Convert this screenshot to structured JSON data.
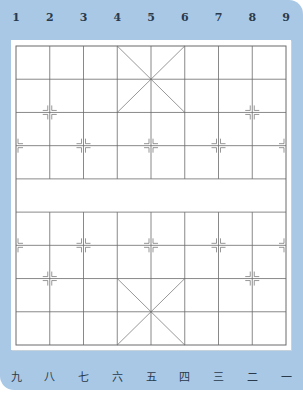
{
  "board": {
    "type": "xiangqi",
    "files": 9,
    "ranks": 10,
    "top_labels": [
      "1",
      "2",
      "3",
      "4",
      "5",
      "6",
      "7",
      "8",
      "9"
    ],
    "bottom_labels": [
      "九",
      "八",
      "七",
      "六",
      "五",
      "四",
      "三",
      "二",
      "一"
    ],
    "colors": {
      "panel": "#a9c8e6",
      "board": "#ffffff",
      "lines": "#6b6b6b",
      "label": "#2a3a4a"
    },
    "markers": [
      {
        "col": 1,
        "row": 2
      },
      {
        "col": 7,
        "row": 2
      },
      {
        "col": 0,
        "row": 3
      },
      {
        "col": 2,
        "row": 3
      },
      {
        "col": 4,
        "row": 3
      },
      {
        "col": 6,
        "row": 3
      },
      {
        "col": 8,
        "row": 3
      },
      {
        "col": 0,
        "row": 6
      },
      {
        "col": 2,
        "row": 6
      },
      {
        "col": 4,
        "row": 6
      },
      {
        "col": 6,
        "row": 6
      },
      {
        "col": 8,
        "row": 6
      },
      {
        "col": 1,
        "row": 7
      },
      {
        "col": 7,
        "row": 7
      }
    ]
  }
}
